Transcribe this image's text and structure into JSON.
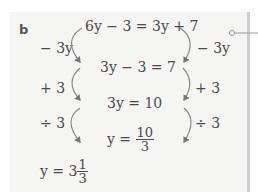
{
  "part_label": "b",
  "equations": {
    "step1": "6y − 3 = 3y + 7",
    "step2": "3y − 3 = 7",
    "step3": "3y = 10",
    "step4_lhs": "y = ",
    "step4_num": "10",
    "step4_den": "3"
  },
  "operations_left": [
    "− 3y",
    "+ 3",
    "÷ 3"
  ],
  "operations_right": [
    "− 3y",
    "+ 3",
    "÷ 3"
  ],
  "answer": {
    "lhs": "y = 3",
    "num": "1",
    "den": "3"
  },
  "colors": {
    "panel_bg": "#f5f5f3",
    "text": "#4a4a4a",
    "arrow": "#777777",
    "border": "#cfcfcf"
  }
}
